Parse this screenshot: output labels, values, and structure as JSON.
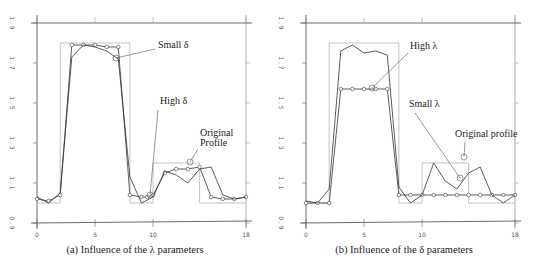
{
  "figure": {
    "panels": [
      {
        "id": "a",
        "caption": "(a) Influence of the λ parameters",
        "annotations": [
          {
            "text": "Small  δ",
            "x": 158,
            "y": 48,
            "lx1": 155,
            "ly1": 49,
            "lx2": 116,
            "ly2": 58
          },
          {
            "text": "High δ",
            "x": 160,
            "y": 104,
            "lx1": 158,
            "ly1": 110,
            "lx2": 150,
            "ly2": 195
          },
          {
            "text": "Original",
            "x": 200,
            "y": 136
          },
          {
            "text": "Profile",
            "x": 200,
            "y": 146,
            "lx1": 198,
            "ly1": 149,
            "lx2": 190,
            "ly2": 162
          }
        ]
      },
      {
        "id": "b",
        "caption": "(b) Influence of the δ  parameters",
        "annotations": [
          {
            "text": "High λ",
            "x": 410,
            "y": 49,
            "lx1": 408,
            "ly1": 53,
            "lx2": 372,
            "ly2": 88
          },
          {
            "text": "Small λ",
            "x": 409,
            "y": 107,
            "lx1": 415,
            "ly1": 113,
            "lx2": 460,
            "ly2": 178
          },
          {
            "text": "Original profile",
            "x": 455,
            "y": 137,
            "lx1": 465,
            "ly1": 142,
            "lx2": 464,
            "ly2": 157
          }
        ]
      }
    ]
  },
  "chart_data": [
    {
      "type": "line",
      "title": "(a) Influence of the λ parameters",
      "xlabel": "",
      "ylabel": "",
      "xlim": [
        0,
        18
      ],
      "ylim": [
        0.9,
        1.9
      ],
      "x_ticks": [
        "0",
        "5",
        "10",
        "18"
      ],
      "y_ticks": [
        "0.9",
        "1.1",
        "1.3",
        "1.5",
        "1.7",
        "1.9"
      ],
      "grid": false,
      "series": [
        {
          "name": "Original Profile",
          "style": "step-light-gray",
          "x": [
            0,
            2,
            2,
            8,
            8,
            10,
            10,
            14,
            14,
            18
          ],
          "values": [
            1.0,
            1.0,
            1.8,
            1.8,
            1.0,
            1.0,
            1.2,
            1.2,
            1.0,
            1.0
          ]
        },
        {
          "name": "Small δ",
          "style": "line-with-circles",
          "x": [
            0,
            1,
            2,
            3,
            4,
            5,
            6,
            7,
            8,
            9,
            9.5,
            10,
            11,
            12,
            13,
            14,
            15,
            16,
            17,
            18
          ],
          "values": [
            1.02,
            1.01,
            1.04,
            1.79,
            1.79,
            1.79,
            1.78,
            1.78,
            1.04,
            1.03,
            1.03,
            1.04,
            1.15,
            1.17,
            1.17,
            1.18,
            1.03,
            1.02,
            1.02,
            1.03
          ]
        },
        {
          "name": "High δ",
          "style": "line",
          "x": [
            0,
            1,
            2,
            3,
            4,
            5,
            6,
            7,
            8,
            9,
            10,
            11,
            12,
            13,
            14,
            15,
            16,
            17,
            18
          ],
          "values": [
            1.03,
            1.0,
            1.05,
            1.73,
            1.79,
            1.78,
            1.76,
            1.72,
            1.13,
            1.0,
            1.03,
            1.16,
            1.14,
            1.1,
            1.17,
            1.18,
            1.04,
            1.02,
            1.03
          ]
        }
      ]
    },
    {
      "type": "line",
      "title": "(b) Influence of the δ  parameters",
      "xlabel": "",
      "ylabel": "",
      "xlim": [
        0,
        18
      ],
      "ylim": [
        0.9,
        1.9
      ],
      "x_ticks": [
        "0",
        "5",
        "10",
        "18"
      ],
      "y_ticks": [
        "0.9",
        "1.1",
        "1.3",
        "1.5",
        "1.7",
        "1.9"
      ],
      "grid": false,
      "series": [
        {
          "name": "Original profile",
          "style": "step-light-gray",
          "x": [
            0,
            2,
            2,
            8,
            8,
            10,
            10,
            14,
            14,
            18
          ],
          "values": [
            1.0,
            1.0,
            1.8,
            1.8,
            1.0,
            1.0,
            1.2,
            1.2,
            1.0,
            1.0
          ]
        },
        {
          "name": "High λ",
          "style": "line-with-circles",
          "x": [
            0,
            1,
            2,
            3,
            4,
            5,
            6,
            7,
            8,
            9,
            10,
            11,
            12,
            13,
            14,
            15,
            16,
            17,
            18
          ],
          "values": [
            1.0,
            1.0,
            1.0,
            1.57,
            1.57,
            1.57,
            1.57,
            1.57,
            1.04,
            1.04,
            1.04,
            1.04,
            1.04,
            1.04,
            1.04,
            1.04,
            1.04,
            1.04,
            1.04
          ]
        },
        {
          "name": "Small λ",
          "style": "line",
          "x": [
            0,
            1,
            2,
            3,
            4,
            5,
            6,
            7,
            8,
            9,
            10,
            11,
            12,
            13,
            14,
            15,
            16,
            17,
            18
          ],
          "values": [
            1.01,
            1.0,
            1.07,
            1.76,
            1.79,
            1.75,
            1.76,
            1.74,
            1.08,
            1.0,
            1.04,
            1.2,
            1.11,
            1.07,
            1.15,
            1.18,
            1.04,
            1.0,
            1.04
          ]
        }
      ]
    }
  ]
}
